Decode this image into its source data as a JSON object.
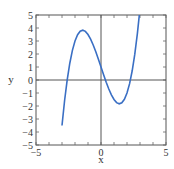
{
  "chart_data": {
    "type": "line",
    "title": "",
    "xlabel": "x",
    "ylabel": "y",
    "xlim": [
      -5,
      5
    ],
    "ylim": [
      -5,
      5
    ],
    "grid": false,
    "legend": null,
    "x_ticks": [
      -5,
      0,
      5
    ],
    "x_tick_labels": [
      "−5",
      "0",
      "5"
    ],
    "y_ticks": [
      -5,
      -4,
      -3,
      -2,
      -1,
      0,
      1,
      2,
      3,
      4,
      5
    ],
    "y_tick_labels": [
      "−5",
      "−4",
      "−3",
      "−2",
      "−1",
      "0",
      "1",
      "2",
      "3",
      "4",
      "5"
    ],
    "minor_tick_step": 1,
    "reference_lines": {
      "x_zero": true,
      "y_zero": true
    },
    "series": [
      {
        "name": "cubic curve",
        "approx_function": "y = 0.5x^3 - 3x + 1",
        "color": "#3a6fc4",
        "key_points": {
          "local_max": [
            -1.41,
            3.83
          ],
          "local_min": [
            1.41,
            -1.83
          ],
          "y_intercept": [
            0,
            1
          ],
          "x_intercepts": [
            -2.6,
            0.34,
            2.26
          ]
        },
        "x": [
          -3.0,
          -2.8,
          -2.6,
          -2.4,
          -2.2,
          -2.0,
          -1.8,
          -1.6,
          -1.4,
          -1.2,
          -1.0,
          -0.8,
          -0.6,
          -0.4,
          -0.2,
          0.0,
          0.2,
          0.4,
          0.6,
          0.8,
          1.0,
          1.2,
          1.4,
          1.6,
          1.8,
          2.0,
          2.2,
          2.4,
          2.6,
          2.8,
          3.0
        ],
        "y": [
          -3.5,
          -1.58,
          0.01,
          1.29,
          2.28,
          3.0,
          3.48,
          3.75,
          3.83,
          3.74,
          3.5,
          3.14,
          2.69,
          2.17,
          1.6,
          1.0,
          0.4,
          -0.17,
          -0.69,
          -1.14,
          -1.5,
          -1.74,
          -1.83,
          -1.75,
          -1.48,
          -1.0,
          -0.28,
          0.71,
          1.99,
          3.58,
          5.5
        ]
      }
    ]
  }
}
